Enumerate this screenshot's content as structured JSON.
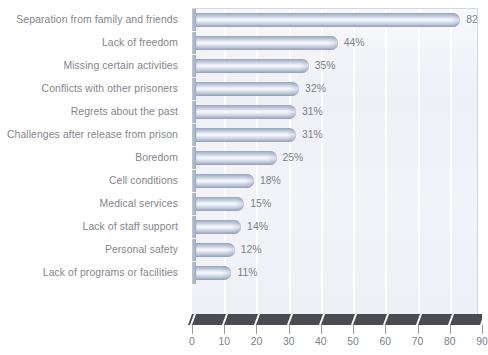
{
  "chart_data": {
    "type": "bar",
    "orientation": "horizontal",
    "title": "",
    "xlabel": "",
    "ylabel": "",
    "xlim": [
      0,
      90
    ],
    "xticks": [
      0,
      10,
      20,
      30,
      40,
      50,
      60,
      70,
      80,
      90
    ],
    "grid": true,
    "grid_axis": "x",
    "legend": false,
    "value_suffix": "%",
    "categories": [
      "Separation from family and friends",
      "Lack of freedom",
      "Missing certain activities",
      "Conflicts with other prisoners",
      "Regrets about the past",
      "Challenges after release from prison",
      "Boredom",
      "Cell conditions",
      "Medical services",
      "Lack of staff support",
      "Personal safety",
      "Lack of programs or facilities"
    ],
    "values": [
      82,
      44,
      35,
      32,
      31,
      31,
      25,
      18,
      15,
      14,
      12,
      11
    ],
    "value_labels": [
      "82%",
      "44%",
      "35%",
      "32%",
      "31%",
      "31%",
      "25%",
      "18%",
      "15%",
      "14%",
      "12%",
      "11%"
    ],
    "tick_labels": [
      "0",
      "10",
      "20",
      "30",
      "40",
      "50",
      "60",
      "70",
      "80",
      "90"
    ],
    "colors": {
      "plot_background": "#eef0f6",
      "gridline": "#ffffff",
      "bar_light": "#f7f9fc",
      "bar_mid": "#c6cfde",
      "bar_dark": "#8e9ab6",
      "baseplate": "#4a4b53",
      "text": "#7e8087",
      "label_text": "#84858a",
      "frame": "#d3d7e3"
    }
  }
}
